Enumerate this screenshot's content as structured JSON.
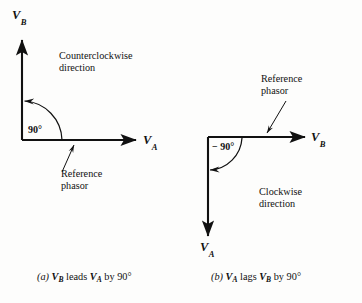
{
  "figure": {
    "type": "phasor-diagram",
    "background_color": "#fdfdfc",
    "ink_color": "#111111",
    "panels": [
      {
        "id": "a",
        "caption_prefix": "(a)",
        "caption_text": "leads",
        "caption_full": "(a) VB leads VA by 90°",
        "caption_by": "by",
        "caption_angle": "90°",
        "horizontal_axis_label": "V",
        "horizontal_axis_sub": "A",
        "vertical_axis_label": "V",
        "vertical_axis_sub": "B",
        "angle_label": "90°",
        "direction_line1": "Counterclockwise",
        "direction_line2": "direction",
        "reference_line1": "Reference",
        "reference_line2": "phasor",
        "leading_phasor": "V",
        "leading_phasor_sub": "B",
        "lagging_phasor": "V",
        "lagging_phasor_sub": "A",
        "rotation": "counterclockwise",
        "angle_value_deg": 90
      },
      {
        "id": "b",
        "caption_prefix": "(b)",
        "caption_text": "lags",
        "caption_full": "(b) VA lags VB by 90°",
        "caption_by": "by",
        "caption_angle": "90°",
        "horizontal_axis_label": "V",
        "horizontal_axis_sub": "B",
        "vertical_axis_label": "V",
        "vertical_axis_sub": "A",
        "angle_label": "− 90°",
        "direction_line1": "Clockwise",
        "direction_line2": "direction",
        "reference_line1": "Reference",
        "reference_line2": "phasor",
        "leading_phasor": "V",
        "leading_phasor_sub": "B",
        "lagging_phasor": "V",
        "lagging_phasor_sub": "A",
        "rotation": "clockwise",
        "angle_value_deg": -90
      }
    ]
  }
}
